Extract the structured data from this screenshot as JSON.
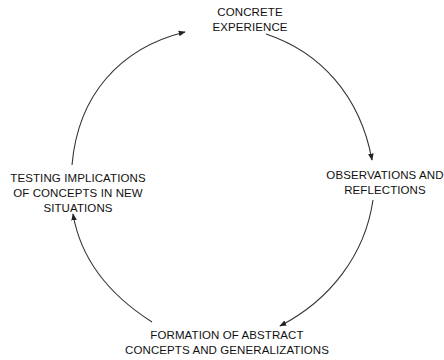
{
  "diagram": {
    "type": "cycle",
    "direction": "clockwise",
    "stroke_color": "#333333",
    "text_color": "#111111",
    "nodes": [
      {
        "id": "top",
        "lines": [
          "CONCRETE",
          "EXPERIENCE"
        ]
      },
      {
        "id": "right",
        "lines": [
          "OBSERVATIONS AND",
          "REFLECTIONS"
        ]
      },
      {
        "id": "bottom",
        "lines": [
          "FORMATION OF ABSTRACT",
          "CONCEPTS AND GENERALIZATIONS"
        ]
      },
      {
        "id": "left",
        "lines": [
          "TESTING IMPLICATIONS",
          "OF CONCEPTS IN NEW",
          "SITUATIONS"
        ]
      }
    ],
    "edges": [
      {
        "from": "top",
        "to": "right"
      },
      {
        "from": "right",
        "to": "bottom"
      },
      {
        "from": "bottom",
        "to": "left"
      },
      {
        "from": "left",
        "to": "top"
      }
    ]
  }
}
